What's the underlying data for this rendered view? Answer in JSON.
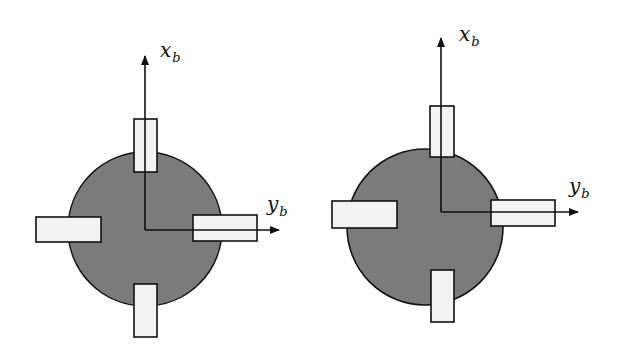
{
  "colors": {
    "background": "#ffffff",
    "body_fill": "#7b7b7b",
    "body_stroke": "#111111",
    "thruster_fill": "#f2f2f2",
    "thruster_stroke": "#111111",
    "axis": "#111111"
  },
  "diagrams": [
    {
      "name": "left-configuration",
      "axis_x_label": {
        "main": "x",
        "sub": "b"
      },
      "axis_y_label": {
        "main": "y",
        "sub": "b"
      },
      "body": {
        "cx": 145,
        "cy": 229,
        "r": 77
      },
      "origin": {
        "x": 145,
        "y": 230
      },
      "x_axis_end": {
        "x": 145,
        "y": 56
      },
      "y_axis_end": {
        "x": 279,
        "y": 230
      },
      "x_label_pos": {
        "x": 160,
        "y": 57
      },
      "y_label_pos": {
        "x": 267,
        "y": 211
      },
      "thrusters": [
        {
          "name": "top",
          "x": 134,
          "y": 119,
          "w": 23,
          "h": 53
        },
        {
          "name": "left",
          "x": 36,
          "y": 217,
          "w": 65,
          "h": 25
        },
        {
          "name": "right",
          "x": 193,
          "y": 215,
          "w": 64,
          "h": 26
        },
        {
          "name": "bottom",
          "x": 134,
          "y": 284,
          "w": 23,
          "h": 53
        }
      ]
    },
    {
      "name": "right-configuration",
      "axis_x_label": {
        "main": "x",
        "sub": "b"
      },
      "axis_y_label": {
        "main": "y",
        "sub": "b"
      },
      "body": {
        "cx": 425,
        "cy": 227,
        "r": 78
      },
      "origin": {
        "x": 441,
        "y": 212
      },
      "x_axis_end": {
        "x": 441,
        "y": 38
      },
      "y_axis_end": {
        "x": 578,
        "y": 212
      },
      "x_label_pos": {
        "x": 459,
        "y": 41
      },
      "y_label_pos": {
        "x": 569,
        "y": 193
      },
      "thrusters": [
        {
          "name": "top",
          "x": 430,
          "y": 106,
          "w": 24,
          "h": 51
        },
        {
          "name": "left",
          "x": 332,
          "y": 201,
          "w": 65,
          "h": 27
        },
        {
          "name": "right",
          "x": 491,
          "y": 200,
          "w": 64,
          "h": 26
        },
        {
          "name": "bottom",
          "x": 431,
          "y": 270,
          "w": 23,
          "h": 52
        }
      ]
    }
  ]
}
